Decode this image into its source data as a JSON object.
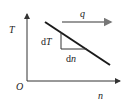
{
  "diagram": {
    "axis_y_label": "T",
    "axis_x_label": "n",
    "origin_label": "O",
    "flux_label": "q",
    "dT_prefix": "d",
    "dT_var": "T",
    "dn_prefix": "d",
    "dn_var": "n",
    "colors": {
      "line": "#1a1a1a",
      "axis": "#333333",
      "arrow": "#666666"
    }
  }
}
